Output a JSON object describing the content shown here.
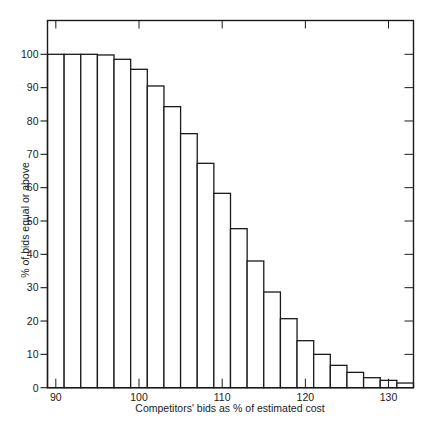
{
  "chart_data": {
    "type": "bar",
    "title": "",
    "xlabel": "Competitors' bids as % of estimated cost",
    "ylabel": "% of bids equal or above",
    "bin_width": 2,
    "categories": [
      90,
      92,
      94,
      96,
      98,
      100,
      102,
      104,
      106,
      108,
      110,
      112,
      114,
      116,
      118,
      120,
      122,
      124,
      126,
      128,
      130,
      132
    ],
    "values": [
      100,
      100,
      100,
      99.8,
      98.5,
      95.5,
      90.5,
      84.3,
      76.2,
      67.3,
      58.3,
      47.7,
      38.0,
      28.7,
      20.7,
      14.1,
      10.0,
      6.7,
      4.6,
      3.0,
      2.2,
      1.4
    ],
    "xlim": [
      89,
      133
    ],
    "ylim": [
      0,
      110
    ],
    "x_ticks": [
      90,
      100,
      110,
      120,
      130
    ],
    "x_tick_labels": [
      "90",
      "100",
      "110",
      "120",
      "130"
    ],
    "y_ticks": [
      0,
      10,
      20,
      30,
      40,
      50,
      60,
      70,
      80,
      90,
      100
    ],
    "y_tick_labels": [
      "0",
      "10",
      "20",
      "30",
      "40",
      "50",
      "60",
      "70",
      "80",
      "90",
      "100"
    ],
    "grid": false,
    "legend": null,
    "colors": {
      "bar_fill": "#ffffff",
      "bar_edge": "#1a1a1a",
      "axis": "#1a1a1a"
    }
  }
}
